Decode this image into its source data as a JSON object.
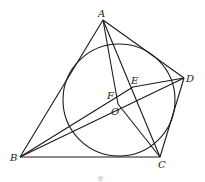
{
  "points": {
    "A": {
      "label": "A",
      "x": 103,
      "y": 20
    },
    "B": {
      "label": "B",
      "x": 20,
      "y": 157
    },
    "C": {
      "label": "C",
      "x": 160,
      "y": 157
    },
    "D": {
      "label": "D",
      "x": 184,
      "y": 78
    },
    "E": {
      "label": "E",
      "x": 133,
      "y": 87
    },
    "F": {
      "label": "F",
      "x": 120,
      "y": 98
    },
    "O": {
      "label": "O",
      "x": 118,
      "y": 104
    }
  },
  "circle": {
    "cx": 119,
    "cy": 100,
    "r": 56
  },
  "caption": "图",
  "stroke_color": "#1a1a1a"
}
